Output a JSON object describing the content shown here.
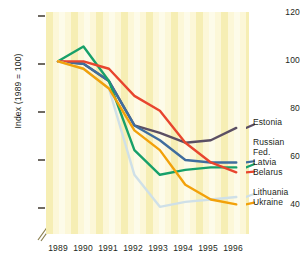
{
  "chart_data": {
    "type": "line",
    "title": "",
    "subtitle": "",
    "xlabel": "",
    "ylabel": "Index (1989 = 100)",
    "x": [
      1989,
      1990,
      1991,
      1992,
      1993,
      1994,
      1995,
      1996
    ],
    "xticklabels": [
      "1989",
      "1990",
      "1991",
      "1992",
      "1993",
      "1994",
      "1995",
      "1996"
    ],
    "yticklabels": [
      "120",
      "100",
      "80",
      "60",
      "40"
    ],
    "yticks": [
      120,
      100,
      80,
      60,
      40
    ],
    "ylim": [
      30,
      120
    ],
    "xlim": [
      1989,
      1996.5
    ],
    "grid": false,
    "axis_break": "y-axis broken below 40",
    "background": "alternating vertical yellow bands",
    "legend_position": "right, labels at line ends",
    "series": [
      {
        "name": "Estonia",
        "color": "#5b4f63",
        "values": [
          100,
          99,
          92,
          74,
          71,
          67,
          68,
          73
        ]
      },
      {
        "name": "Russian Fed.",
        "color": "#3f6d9e",
        "values": [
          100,
          99,
          92,
          74,
          68,
          60,
          59,
          59
        ]
      },
      {
        "name": "Latvia",
        "color": "#17a06a",
        "values": [
          100,
          106,
          92,
          64,
          54,
          56,
          57,
          57
        ]
      },
      {
        "name": "Belarus",
        "color": "#e8452e",
        "values": [
          100,
          100,
          97,
          86,
          80,
          67,
          59,
          55
        ]
      },
      {
        "name": "Lithuania",
        "color": "#cfe0e8",
        "values": [
          100,
          97,
          89,
          54,
          41,
          43,
          44,
          45
        ]
      },
      {
        "name": "Ukraine",
        "color": "#f2a10a",
        "values": [
          100,
          97,
          89,
          72,
          64,
          50,
          44,
          42
        ]
      }
    ]
  },
  "legend": {
    "items": [
      {
        "label": "Estonia",
        "top": 117,
        "color": "#5b4f63"
      },
      {
        "label": "Russian",
        "top": 137,
        "color": "#3f6d9e"
      },
      {
        "label": "Fed.",
        "top": 147,
        "color": "#3f6d9e"
      },
      {
        "label": "Latvia",
        "top": 157,
        "color": "#17a06a"
      },
      {
        "label": "Belarus",
        "top": 167,
        "color": "#e8452e"
      },
      {
        "label": "Lithuania",
        "top": 187,
        "color": "#cfe0e8"
      },
      {
        "label": "Ukraine",
        "top": 197,
        "color": "#f2a10a"
      }
    ]
  },
  "axes": {
    "y_title": "Index (1989 = 100)",
    "y_ticks": [
      {
        "label": "120",
        "top": 12
      },
      {
        "label": "100",
        "top": 60
      },
      {
        "label": "80",
        "top": 108
      },
      {
        "label": "60",
        "top": 156
      },
      {
        "label": "40",
        "top": 204
      }
    ],
    "x_ticks": [
      {
        "label": "1989",
        "left": 58
      },
      {
        "label": "1990",
        "left": 83
      },
      {
        "label": "1991",
        "left": 108
      },
      {
        "label": "1992",
        "left": 133
      },
      {
        "label": "1993",
        "left": 158
      },
      {
        "label": "1994",
        "left": 183
      },
      {
        "label": "1995",
        "left": 208
      },
      {
        "label": "1996",
        "left": 233
      }
    ]
  }
}
